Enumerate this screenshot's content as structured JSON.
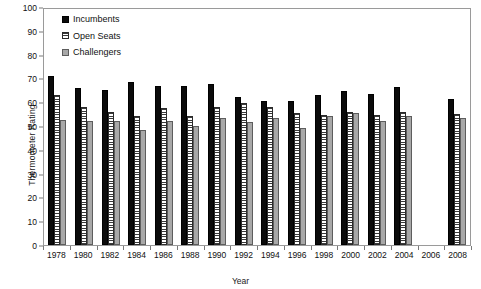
{
  "chart_data": {
    "type": "bar",
    "title": "",
    "xlabel": "Year",
    "ylabel": "Thermometer Rating",
    "ylim": [
      0,
      100
    ],
    "ytick_step": 10,
    "yticks": [
      0,
      10,
      20,
      30,
      40,
      50,
      60,
      70,
      80,
      90,
      100
    ],
    "grid": false,
    "legend_position": "top-left-inside",
    "categories": [
      "1978",
      "1980",
      "1982",
      "1984",
      "1986",
      "1988",
      "1990",
      "1992",
      "1994",
      "1996",
      "1998",
      "2000",
      "2002",
      "2004",
      "2006",
      "2008"
    ],
    "series": [
      {
        "name": "Incumbents",
        "color": "#0b0b0b",
        "pattern": "solid",
        "values": [
          71,
          66,
          65,
          68.5,
          67,
          66.8,
          67.5,
          62,
          60.5,
          60.5,
          63,
          64.8,
          63.5,
          66.5,
          null,
          61.5
        ]
      },
      {
        "name": "Open Seats",
        "color": "#ffffff",
        "pattern": "horizontal-lines",
        "values": [
          63,
          58,
          56,
          54,
          57.5,
          54,
          58,
          59.5,
          58,
          55.5,
          54.5,
          55.8,
          54.5,
          56,
          null,
          55
        ]
      },
      {
        "name": "Challengers",
        "color": "#a8a8a8",
        "pattern": "solid-gray",
        "values": [
          52.5,
          52,
          52,
          48.5,
          52.3,
          50,
          53.5,
          51.5,
          53.5,
          49,
          54,
          55.5,
          52,
          54,
          null,
          53.5
        ]
      }
    ]
  },
  "legend": {
    "items": [
      {
        "label": "Incumbents"
      },
      {
        "label": "Open Seats"
      },
      {
        "label": "Challengers"
      }
    ]
  }
}
